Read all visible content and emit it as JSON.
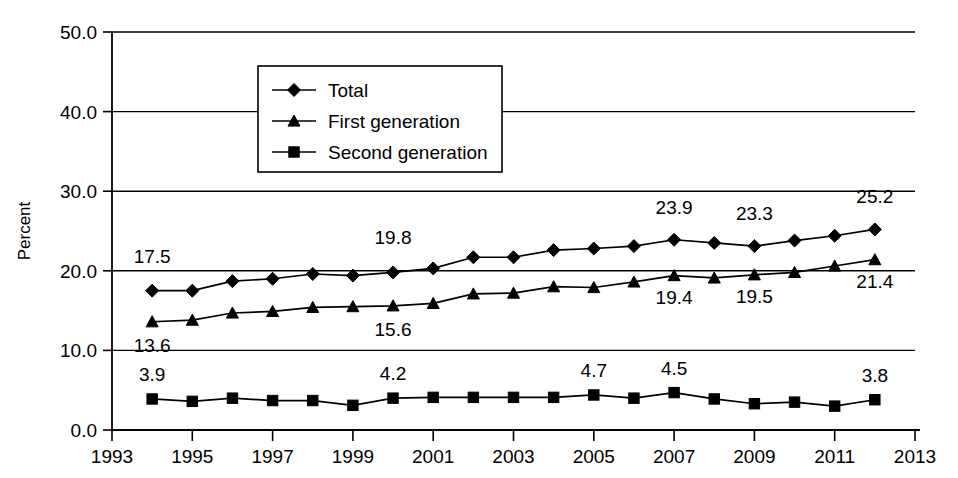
{
  "chart_data": {
    "type": "line",
    "title": "",
    "xlabel": "",
    "ylabel": "Percent",
    "ylim": [
      0.0,
      50.0
    ],
    "xlim": [
      1993,
      2013
    ],
    "grid": true,
    "legend_position": "top-center",
    "y_ticks": [
      "0.0",
      "10.0",
      "20.0",
      "30.0",
      "40.0",
      "50.0"
    ],
    "x_ticks": [
      "1993",
      "1995",
      "1997",
      "1999",
      "2001",
      "2003",
      "2005",
      "2007",
      "2009",
      "2011",
      "2013"
    ],
    "x": [
      1994,
      1995,
      1996,
      1997,
      1998,
      1999,
      2000,
      2001,
      2002,
      2003,
      2004,
      2005,
      2006,
      2007,
      2008,
      2009,
      2010,
      2011,
      2012
    ],
    "series": [
      {
        "name": "Total",
        "marker": "diamond",
        "values": [
          17.5,
          17.5,
          18.7,
          19.0,
          19.6,
          19.4,
          19.8,
          20.3,
          21.7,
          21.7,
          22.6,
          22.8,
          23.1,
          23.9,
          23.5,
          23.1,
          23.8,
          24.4,
          25.2
        ],
        "labels": [
          {
            "x": 1994,
            "value": "17.5"
          },
          {
            "x": 2000,
            "value": "19.8"
          },
          {
            "x": 2007,
            "value": "23.9"
          },
          {
            "x": 2009,
            "value": "23.3"
          },
          {
            "x": 2012,
            "value": "25.2"
          }
        ]
      },
      {
        "name": "First generation",
        "marker": "triangle",
        "values": [
          13.6,
          13.8,
          14.7,
          14.9,
          15.4,
          15.5,
          15.6,
          15.9,
          17.1,
          17.2,
          18.0,
          17.9,
          18.6,
          19.4,
          19.1,
          19.5,
          19.8,
          20.6,
          21.4
        ],
        "labels": [
          {
            "x": 1994,
            "value": "13.6"
          },
          {
            "x": 2000,
            "value": "15.6"
          },
          {
            "x": 2007,
            "value": "19.4"
          },
          {
            "x": 2009,
            "value": "19.5"
          },
          {
            "x": 2012,
            "value": "21.4"
          }
        ]
      },
      {
        "name": "Second generation",
        "marker": "square",
        "values": [
          3.9,
          3.6,
          4.0,
          3.7,
          3.7,
          3.1,
          4.0,
          4.1,
          4.1,
          4.1,
          4.1,
          4.4,
          4.0,
          4.7,
          3.9,
          3.3,
          3.5,
          3.0,
          3.8
        ],
        "labels": [
          {
            "x": 1994,
            "value": "3.9"
          },
          {
            "x": 2000,
            "value": "4.2"
          },
          {
            "x": 2005,
            "value": "4.7"
          },
          {
            "x": 2007,
            "value": "4.5"
          },
          {
            "x": 2012,
            "value": "3.8"
          }
        ]
      }
    ],
    "legend": [
      {
        "label": "Total",
        "marker": "diamond"
      },
      {
        "label": "First generation",
        "marker": "triangle"
      },
      {
        "label": "Second generation",
        "marker": "square"
      }
    ]
  }
}
